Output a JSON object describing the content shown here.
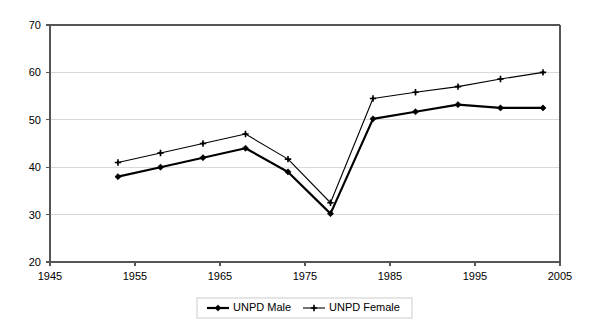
{
  "chart_data": {
    "type": "line",
    "title": "",
    "subtitle": "",
    "xlabel": "",
    "ylabel": "",
    "xlim": [
      1945,
      2005
    ],
    "ylim": [
      20,
      70
    ],
    "xticks": [
      1945,
      1955,
      1965,
      1975,
      1985,
      1995,
      2005
    ],
    "yticks": [
      20,
      30,
      40,
      50,
      60,
      70
    ],
    "xtick_labels": [
      "1945",
      "1955",
      "1965",
      "1975",
      "1985",
      "1995",
      "2005"
    ],
    "ytick_labels": [
      "20",
      "30",
      "40",
      "50",
      "60",
      "70"
    ],
    "grid": "horizontal",
    "legend_position": "bottom",
    "x": [
      1953,
      1958,
      1963,
      1968,
      1973,
      1978,
      1983,
      1988,
      1993,
      1998,
      2003
    ],
    "series": [
      {
        "name": "UNPD Male",
        "color": "#000000",
        "line_width": 2.2,
        "marker": "diamond",
        "values": [
          38.0,
          40.0,
          42.0,
          44.0,
          39.0,
          30.2,
          50.2,
          51.7,
          53.2,
          52.5,
          52.5
        ]
      },
      {
        "name": "UNPD Female",
        "color": "#000000",
        "line_width": 1.1,
        "marker": "plus",
        "values": [
          41.0,
          43.0,
          45.0,
          47.0,
          41.7,
          32.5,
          54.5,
          55.8,
          57.0,
          58.6,
          60.0
        ]
      }
    ]
  },
  "legend": {
    "items": [
      {
        "label": "UNPD Male"
      },
      {
        "label": "UNPD Female"
      }
    ]
  }
}
